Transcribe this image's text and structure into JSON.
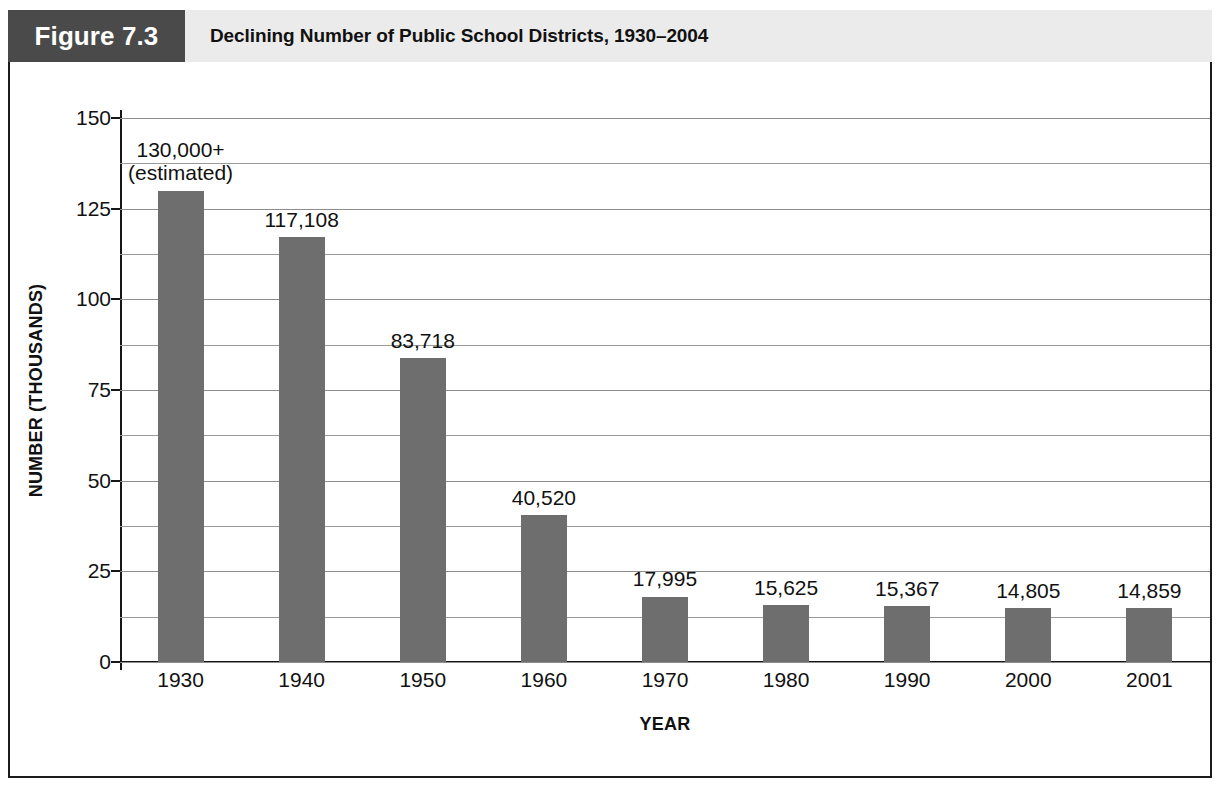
{
  "figure": {
    "number_label": "Figure 7.3",
    "title": "Declining Number of Public School Districts, 1930–2004",
    "source_note": ""
  },
  "colors": {
    "figure_number_box": "#4a4a4a",
    "figure_title_band": "#ebebeb",
    "bar_fill": "#6e6e6e",
    "axis_line": "#171717",
    "gridline": "#8d8d8d",
    "frame_border": "#1b1b1b",
    "text": "#111111"
  },
  "chart_data": {
    "type": "bar",
    "title": "Declining Number of Public School Districts, 1930–2004",
    "xlabel": "YEAR",
    "ylabel": "NUMBER (THOUSANDS)",
    "categories": [
      "1930",
      "1940",
      "1950",
      "1960",
      "1970",
      "1980",
      "1990",
      "2000",
      "2001"
    ],
    "values": [
      130000,
      117108,
      83718,
      40520,
      17995,
      15625,
      15367,
      14805,
      14859
    ],
    "values_thousands": [
      130.0,
      117.108,
      83.718,
      40.52,
      17.995,
      15.625,
      15.367,
      14.805,
      14.859
    ],
    "data_labels": [
      {
        "line1": "130,000+",
        "line2": "(estimated)"
      },
      {
        "line1": "117,108",
        "line2": ""
      },
      {
        "line1": "83,718",
        "line2": ""
      },
      {
        "line1": "40,520",
        "line2": ""
      },
      {
        "line1": "17,995",
        "line2": ""
      },
      {
        "line1": "15,625",
        "line2": ""
      },
      {
        "line1": "15,367",
        "line2": ""
      },
      {
        "line1": "14,805",
        "line2": ""
      },
      {
        "line1": "14,859",
        "line2": ""
      }
    ],
    "ylim": [
      0,
      150
    ],
    "yticks": [
      0,
      25,
      50,
      75,
      100,
      125,
      150
    ],
    "ytick_labels": [
      "0",
      "25",
      "50",
      "75",
      "100",
      "125",
      "150"
    ],
    "minor_gridline_step": 12.5,
    "grid": true,
    "legend": false,
    "units": "thousands of districts"
  }
}
